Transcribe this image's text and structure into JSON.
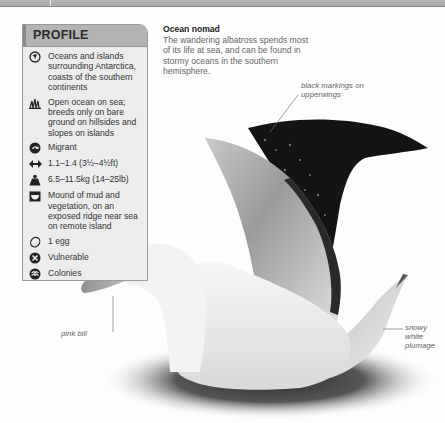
{
  "profile": {
    "title": "PROFILE",
    "items": [
      {
        "icon": "globe-icon",
        "text": "Oceans and islands surrounding Antarctica, coasts of the southern continents"
      },
      {
        "icon": "grass-habitat-icon",
        "text": "Open ocean on sea; breeds only on bare ground on hillsides and slopes on islands"
      },
      {
        "icon": "migration-icon",
        "text": "Migrant"
      },
      {
        "icon": "wingspan-icon",
        "text": "1.1–1.4 (3½–4½ft)"
      },
      {
        "icon": "weight-icon",
        "text": "6.5–11.5kg (14–25lb)"
      },
      {
        "icon": "nest-icon",
        "text": "Mound of mud and vegetation, on an exposed ridge near sea on remote island"
      },
      {
        "icon": "egg-icon",
        "text": "1 egg"
      },
      {
        "icon": "conservation-status-icon",
        "text": "Vulnerable"
      },
      {
        "icon": "social-group-icon",
        "text": "Colonies"
      }
    ]
  },
  "caption": {
    "title": "Ocean nomad",
    "body": "The wandering albatross spends most of its life at sea, and can be found in stormy oceans in the southern hemisphere."
  },
  "annotations": {
    "black_markings": "black markings on upperwings",
    "pink_bill": "pink bill",
    "snowy_plumage": "snowy white plumage"
  },
  "colors": {
    "profile_bg": "#ececec",
    "profile_header": "#b3b3b3",
    "bill": "#e0a690"
  }
}
